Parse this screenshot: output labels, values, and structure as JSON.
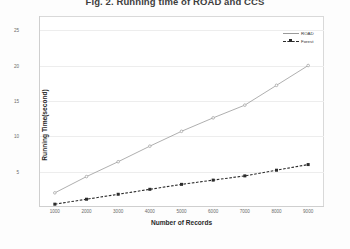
{
  "figure": {
    "title": "Fig. 2. Running time of ROAD and CCS"
  },
  "axis": {
    "y_title": "Running Time(second)",
    "x_title": "Number of Records"
  },
  "legend": {
    "position": "top-right",
    "entries": [
      {
        "label": "ROAD",
        "color": "#9a9a9a",
        "style": "solid",
        "marker": "none"
      },
      {
        "label": "Forest",
        "color": "#2b2b2b",
        "style": "dashed",
        "marker": "square"
      }
    ]
  },
  "chart_data": {
    "type": "line",
    "title": "Fig. 2. Running time of ROAD and CCS",
    "xlabel": "Number of Records",
    "ylabel": "Running Time(second)",
    "x": [
      1000,
      2000,
      3000,
      4000,
      5000,
      6000,
      7000,
      8000,
      9000
    ],
    "categories": [
      "1000",
      "2000",
      "3000",
      "4000",
      "5000",
      "6000",
      "7000",
      "8000",
      "9000"
    ],
    "xlim": [
      500,
      9500
    ],
    "ylim": [
      0,
      27
    ],
    "yticks": [
      5,
      10,
      15,
      20,
      25
    ],
    "ytick_labels": [
      "5",
      "10",
      "15",
      "20",
      "25"
    ],
    "xtick_labels": [
      "1000",
      "2000",
      "3000",
      "4000",
      "5000",
      "6000",
      "7000",
      "8000",
      "9000"
    ],
    "grid": true,
    "grid_axis": "y",
    "legend_position": "top-right",
    "series": [
      {
        "name": "ROAD",
        "color": "#9a9a9a",
        "style": "solid",
        "marker": "circle",
        "values": [
          2.0,
          4.3,
          6.4,
          8.6,
          10.7,
          12.6,
          14.4,
          17.2,
          20.0
        ]
      },
      {
        "name": "Forest",
        "color": "#2b2b2b",
        "style": "dashed",
        "marker": "square",
        "values": [
          0.4,
          1.1,
          1.8,
          2.5,
          3.2,
          3.8,
          4.4,
          5.2,
          6.0
        ]
      }
    ]
  }
}
